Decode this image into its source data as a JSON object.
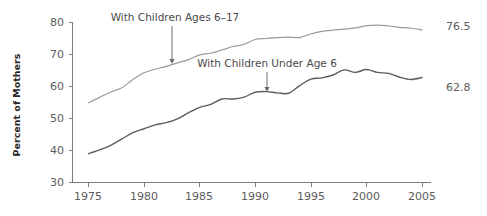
{
  "chart_data": {
    "type": "line",
    "title": "",
    "xlabel": "",
    "ylabel": "Percent of Mothers",
    "xlim": [
      1972,
      2006
    ],
    "ylim": [
      30,
      80
    ],
    "grid": false,
    "legend_position": "inline-annotation",
    "x_ticks": [
      "1975",
      "1980",
      "1985",
      "1990",
      "1995",
      "2000",
      "2005"
    ],
    "y_ticks": [
      "30",
      "40",
      "50",
      "60",
      "70",
      "80"
    ],
    "x": [
      1975,
      1976,
      1977,
      1978,
      1979,
      1980,
      1981,
      1982,
      1983,
      1984,
      1985,
      1986,
      1987,
      1988,
      1989,
      1990,
      1991,
      1992,
      1993,
      1994,
      1995,
      1996,
      1997,
      1998,
      1999,
      2000,
      2001,
      2002,
      2003,
      2004,
      2005
    ],
    "series": [
      {
        "name": "With Children Ages 6-17",
        "color": "#9a9a9a",
        "end_value": 76.5,
        "values": [
          54.9,
          56.6,
          58.3,
          59.6,
          62.2,
          64.3,
          65.4,
          66.3,
          67.4,
          68.4,
          69.9,
          70.4,
          71.4,
          72.5,
          73.2,
          74.7,
          75.0,
          75.3,
          75.4,
          75.3,
          76.4,
          77.2,
          77.6,
          77.9,
          78.3,
          79.0,
          79.2,
          78.9,
          78.5,
          78.2,
          77.7
        ]
      },
      {
        "name": "With Children Under Age 6",
        "color": "#5c5c5c",
        "end_value": 62.8,
        "values": [
          39.0,
          40.2,
          41.6,
          43.6,
          45.6,
          46.8,
          48.0,
          48.7,
          49.9,
          51.8,
          53.5,
          54.4,
          56.1,
          56.1,
          56.7,
          58.2,
          58.4,
          58.0,
          57.9,
          60.3,
          62.3,
          62.7,
          63.6,
          65.2,
          64.4,
          65.3,
          64.4,
          64.1,
          62.9,
          62.2,
          62.8
        ]
      }
    ],
    "annotations": [
      {
        "text": "With Children Ages 6–17",
        "text_x": 175,
        "text_y": 21,
        "arrow_x": 172,
        "arrow_y0": 26,
        "arrow_y1": 64
      },
      {
        "text": "With Children Under Age 6",
        "text_x": 267,
        "text_y": 67,
        "arrow_x": 267,
        "arrow_y0": 72,
        "arrow_y1": 92
      }
    ]
  },
  "axis": {
    "y_label": "Percent of Mothers"
  },
  "value_labels": [
    {
      "text": "76.5",
      "x": 446,
      "y": 30
    },
    {
      "text": "62.8",
      "x": 446,
      "y": 91
    }
  ]
}
